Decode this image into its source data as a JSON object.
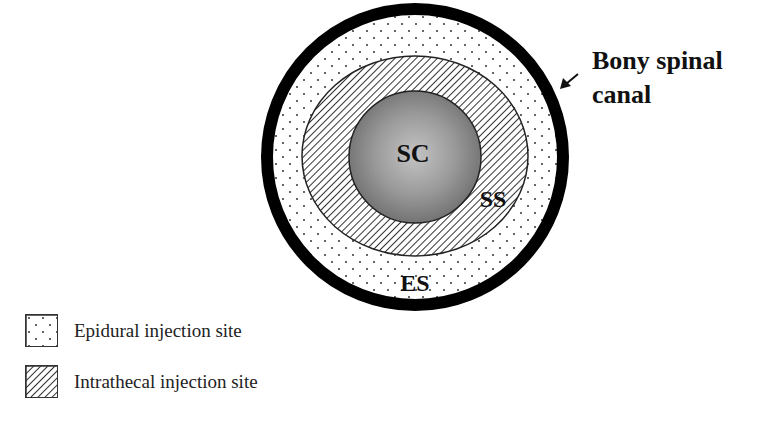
{
  "diagram": {
    "regions": {
      "spinal_cord": {
        "label": "SC",
        "fill": "#8a8a8a"
      },
      "subarachnoid_space": {
        "label": "SS",
        "pattern": "diagonal-hatch"
      },
      "epidural_space": {
        "label": "ES",
        "pattern": "dots"
      },
      "bony_canal": {
        "stroke": "#000000"
      }
    },
    "callout": {
      "line1": "Bony spinal",
      "line2": "canal"
    }
  },
  "legend": {
    "items": [
      {
        "label": "Epidural injection site",
        "pattern": "dots"
      },
      {
        "label": "Intrathecal injection site",
        "pattern": "diagonal-hatch"
      }
    ]
  }
}
